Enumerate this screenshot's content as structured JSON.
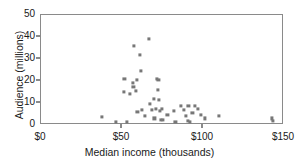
{
  "chart_data": {
    "type": "scatter",
    "title": "",
    "xlabel": "Median income (thousands)",
    "ylabel": "Audience (millions)",
    "xlim": [
      0,
      150
    ],
    "ylim": [
      0,
      50
    ],
    "xticks": [
      0,
      50,
      100,
      150
    ],
    "xtick_labels": [
      "$0",
      "$50",
      "$100",
      "$150"
    ],
    "yticks": [
      0,
      10,
      20,
      30,
      40,
      50
    ],
    "ytick_labels": [
      "0",
      "10",
      "20",
      "30",
      "40",
      "50"
    ],
    "grid": false,
    "legend": null,
    "marker_color": "#777777",
    "axis_color": "#8a8a8a",
    "points": [
      {
        "x": 37.5,
        "y": 3.5
      },
      {
        "x": 46.0,
        "y": 1.5
      },
      {
        "x": 51.5,
        "y": 21.0
      },
      {
        "x": 51.0,
        "y": 15.0
      },
      {
        "x": 53.0,
        "y": 1.5
      },
      {
        "x": 55.0,
        "y": 14.0
      },
      {
        "x": 56.5,
        "y": 19.0
      },
      {
        "x": 57.0,
        "y": 17.5
      },
      {
        "x": 57.5,
        "y": 36.0
      },
      {
        "x": 58.5,
        "y": 15.5
      },
      {
        "x": 59.0,
        "y": 20.5
      },
      {
        "x": 59.5,
        "y": 6.0
      },
      {
        "x": 61.0,
        "y": 32.0
      },
      {
        "x": 61.5,
        "y": 24.5
      },
      {
        "x": 62.5,
        "y": 7.0
      },
      {
        "x": 64.0,
        "y": 4.0
      },
      {
        "x": 66.5,
        "y": 39.0
      },
      {
        "x": 67.0,
        "y": 9.5
      },
      {
        "x": 68.5,
        "y": 7.0
      },
      {
        "x": 69.5,
        "y": 12.0
      },
      {
        "x": 70.0,
        "y": 3.0
      },
      {
        "x": 71.0,
        "y": 7.5
      },
      {
        "x": 71.5,
        "y": 21.0
      },
      {
        "x": 72.0,
        "y": 16.0
      },
      {
        "x": 72.5,
        "y": 20.5
      },
      {
        "x": 73.0,
        "y": 11.5
      },
      {
        "x": 73.5,
        "y": 6.5
      },
      {
        "x": 74.0,
        "y": 2.5
      },
      {
        "x": 74.5,
        "y": 7.5
      },
      {
        "x": 75.5,
        "y": 2.5
      },
      {
        "x": 78.0,
        "y": 4.5
      },
      {
        "x": 82.0,
        "y": 6.5
      },
      {
        "x": 83.0,
        "y": 1.5
      },
      {
        "x": 86.5,
        "y": 8.5
      },
      {
        "x": 88.0,
        "y": 7.0
      },
      {
        "x": 89.5,
        "y": 4.0
      },
      {
        "x": 90.5,
        "y": 2.0
      },
      {
        "x": 91.0,
        "y": 8.5
      },
      {
        "x": 92.0,
        "y": 1.5
      },
      {
        "x": 93.5,
        "y": 5.5
      },
      {
        "x": 95.0,
        "y": 8.5
      },
      {
        "x": 97.0,
        "y": 7.5
      },
      {
        "x": 98.5,
        "y": 4.5
      },
      {
        "x": 101.0,
        "y": 3.0
      },
      {
        "x": 110.0,
        "y": 4.0
      },
      {
        "x": 142.5,
        "y": 3.0
      },
      {
        "x": 143.0,
        "y": 2.0
      }
    ]
  }
}
